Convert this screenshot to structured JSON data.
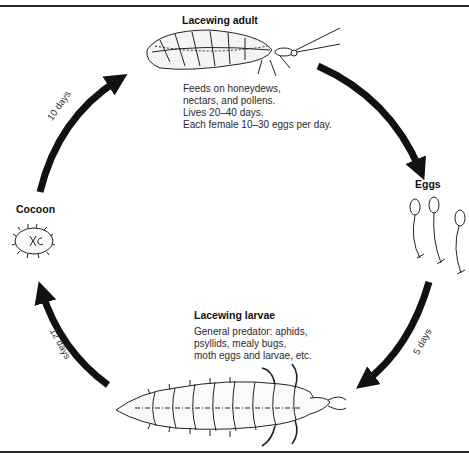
{
  "diagram": {
    "type": "life-cycle",
    "subject": "Lacewing",
    "stages": [
      {
        "id": "adult",
        "label": "Lacewing adult",
        "notes": [
          "Feeds on honeydews,",
          "nectars, and pollens.",
          "Lives 20–40 days.",
          "Each female 10–30 eggs per day."
        ]
      },
      {
        "id": "eggs",
        "label": "Eggs"
      },
      {
        "id": "larvae",
        "label": "Lacewing larvae",
        "notes": [
          "General predator: aphids,",
          "psyllids, mealy bugs,",
          "moth eggs and larvae, etc."
        ]
      },
      {
        "id": "cocoon",
        "label": "Cocoon"
      }
    ],
    "transitions": [
      {
        "from": "adult",
        "to": "eggs",
        "label": ""
      },
      {
        "from": "eggs",
        "to": "larvae",
        "label": "5 days"
      },
      {
        "from": "larvae",
        "to": "cocoon",
        "label": "12 days"
      },
      {
        "from": "cocoon",
        "to": "adult",
        "label": "10 days"
      }
    ],
    "colors": {
      "arrow": "#111111",
      "ink": "#1a1a1a",
      "rule": "#2a2a2a"
    }
  }
}
